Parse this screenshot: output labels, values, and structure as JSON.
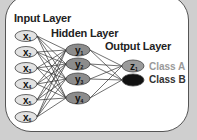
{
  "diagram": {
    "layers": {
      "input": {
        "title": "Input Layer",
        "nodes": [
          "x1",
          "x2",
          "x3",
          "x4",
          "x5",
          "x6"
        ]
      },
      "hidden": {
        "title": "Hidden Layer",
        "nodes": [
          "y1",
          "y2",
          "y3",
          "y4"
        ]
      },
      "output": {
        "title": "Output Layer",
        "nodes": [
          "z1",
          "z2"
        ]
      }
    },
    "classes": [
      {
        "label": "Class A",
        "color": "#9a9a9a"
      },
      {
        "label": "Class B",
        "color": "#333333"
      }
    ],
    "colors": {
      "background": "#cfcfcf",
      "panel": "#ffffff",
      "input_node_fill": "#e2e2e2",
      "hidden_node_fill": "#8c8c8c",
      "output_node_a_fill": "#9a9a9a",
      "output_node_b_fill": "#111111",
      "edge": "#333333"
    },
    "connections": "fully-connected"
  }
}
